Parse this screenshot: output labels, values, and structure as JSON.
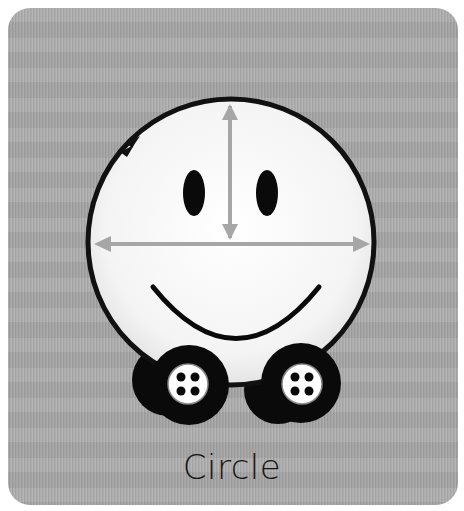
{
  "card": {
    "caption": "Circle",
    "background_color": "#a9a9a9"
  },
  "illustration": {
    "subject": "smiling-circle-character-on-wheels",
    "face_fill": "#f7f7f7",
    "outline_color": "#111111",
    "arrow_color": "#a6a6a6",
    "features": [
      "eyes",
      "smile",
      "diameter-arrow-horizontal",
      "radius-arrow-vertical",
      "circumference-arrow",
      "wheels"
    ]
  }
}
